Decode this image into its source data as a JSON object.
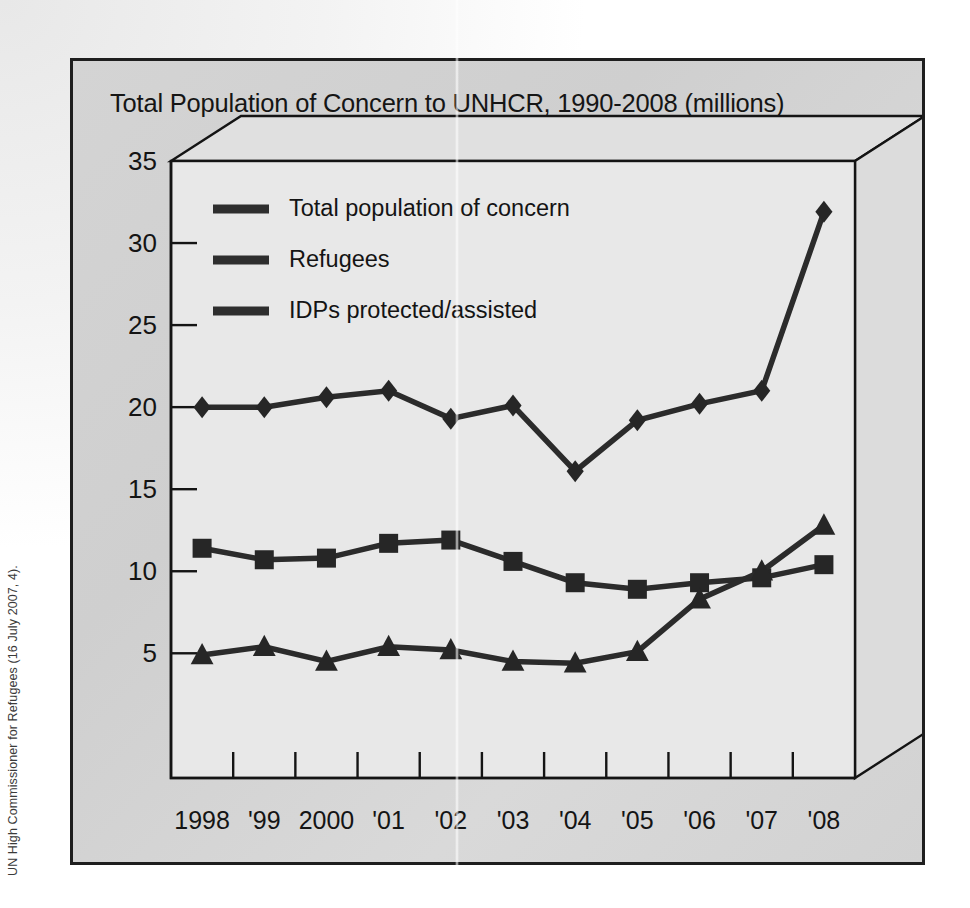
{
  "credit": {
    "text": "UN High Commissioner for Refugees (16 July 2007, 4)."
  },
  "figure": {
    "title": "Total Population of Concern to UNHCR, 1990-2008 (millions)"
  },
  "colors": {
    "frame_border": "#1e1e1e",
    "figure_background": "#d4d4d4",
    "plot_background": "#e8e8e8",
    "line": "#2b2b2b",
    "marker": "#262626",
    "text": "#141414"
  },
  "chart_data": {
    "type": "line",
    "title": "Total Population of Concern to UNHCR, 1990-2008 (millions)",
    "xlabel": "",
    "ylabel": "",
    "ylim": [
      0,
      35
    ],
    "yticks": [
      5,
      10,
      15,
      20,
      25,
      30,
      35
    ],
    "ytick_labels": [
      "5",
      "10",
      "15",
      "20",
      "25",
      "30",
      "35"
    ],
    "grid": false,
    "legend_position": "upper-left-inside",
    "categories": [
      "1998",
      "'99",
      "2000",
      "'01",
      "'02",
      "'03",
      "'04",
      "'05",
      "'06",
      "'07",
      "'08"
    ],
    "series": [
      {
        "name": "Total population of concern",
        "marker": "diamond",
        "values": [
          20.0,
          20.0,
          20.6,
          21.0,
          19.3,
          20.1,
          16.1,
          19.2,
          20.2,
          21.0,
          31.9
        ]
      },
      {
        "name": "Refugees",
        "marker": "square",
        "values": [
          11.4,
          10.7,
          10.8,
          11.7,
          11.9,
          10.6,
          9.3,
          8.9,
          9.3,
          9.6,
          10.4
        ]
      },
      {
        "name": "IDPs protected/assisted",
        "marker": "triangle",
        "values": [
          4.9,
          5.4,
          4.5,
          5.4,
          5.2,
          4.5,
          4.4,
          5.1,
          8.3,
          10.0,
          12.8
        ]
      }
    ]
  }
}
